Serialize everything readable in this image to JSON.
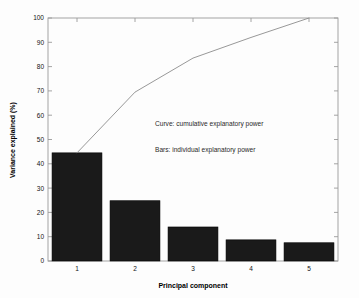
{
  "chart_data": {
    "type": "bar",
    "title": "",
    "subtitle": "",
    "xlabel": "Principal component",
    "ylabel": "Variance explained (%)",
    "categories": [
      "1",
      "2",
      "3",
      "4",
      "5"
    ],
    "values": [
      44.5,
      24.8,
      14.0,
      8.7,
      7.5
    ],
    "series": [
      {
        "name": "Bars: individual explanatory power",
        "type": "bar",
        "values": [
          44.5,
          24.8,
          14.0,
          8.7,
          7.5
        ]
      },
      {
        "name": "Curve: cumulative explanatory power",
        "type": "line",
        "values": [
          44.5,
          69.5,
          83.5,
          92.0,
          100.0
        ]
      }
    ],
    "x": [
      1,
      2,
      3,
      4,
      5
    ],
    "xlim": [
      0.5,
      5.5
    ],
    "ylim": [
      0,
      100
    ],
    "yticks": [
      0,
      10,
      20,
      30,
      40,
      50,
      60,
      70,
      80,
      90,
      100
    ],
    "ytick_labels": [
      "0",
      "10",
      "20",
      "30",
      "40",
      "50",
      "60",
      "70",
      "80",
      "90",
      "100"
    ],
    "xticks": [
      1,
      2,
      3,
      4,
      5
    ],
    "xtick_labels": [
      "1",
      "2",
      "3",
      "4",
      "5"
    ],
    "grid": false,
    "legend_position": "inside-annotations",
    "annotations": [
      {
        "text": "Curve: cumulative explanatory power",
        "x": 2.35,
        "y": 57
      },
      {
        "text": "Bars: individual explanatory power",
        "x": 2.35,
        "y": 46
      }
    ],
    "colors": {
      "bar_fill": "#1a1a1a",
      "bar_edge": "#000000",
      "curve": "#8c8c8c",
      "axis": "#9a9a9a",
      "text": "#111111",
      "background": "#fdfdfd"
    }
  },
  "axes": {
    "y_title": "Variance explained (%)",
    "x_title": "Principal component"
  },
  "annotations": {
    "curve_note": "Curve: cumulative explanatory power",
    "bars_note": "Bars: individual explanatory power"
  }
}
